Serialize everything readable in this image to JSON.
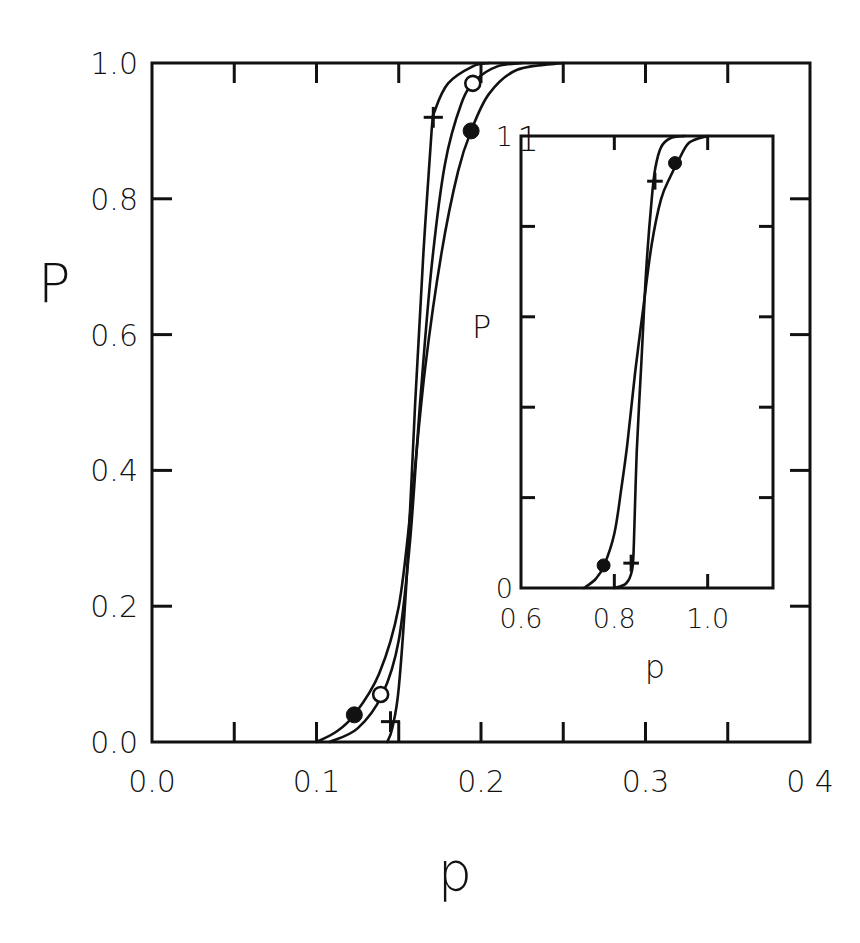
{
  "chart_data": [
    {
      "id": "main",
      "type": "line",
      "title": "",
      "xlabel": "p",
      "ylabel": "P",
      "xlim": [
        0.0,
        0.4
      ],
      "ylim": [
        0.0,
        1.0
      ],
      "grid": false,
      "legend": null,
      "x_ticks": [
        0.0,
        0.05,
        0.1,
        0.15,
        0.2,
        0.25,
        0.3,
        0.35,
        0.4
      ],
      "x_tick_labels": [
        "0.0",
        "0.1",
        "0.2",
        "0.3",
        "0 4"
      ],
      "x_tick_label_values": [
        0.0,
        0.1,
        0.2,
        0.3,
        0.4
      ],
      "y_ticks": [
        0.0,
        0.2,
        0.4,
        0.6,
        0.8,
        1.0
      ],
      "y_tick_labels": [
        "0.0",
        "0.2",
        "0.4",
        "0.6",
        "0.8",
        "1.0"
      ],
      "annotations": [
        {
          "text": "1",
          "x": 0.222,
          "y": 0.87
        }
      ],
      "series": [
        {
          "name": "plus",
          "marker": "plus",
          "x": [
            0.143,
            0.146,
            0.15,
            0.155,
            0.16,
            0.165,
            0.17,
            0.172,
            0.18,
            0.195,
            0.205
          ],
          "y": [
            0.0,
            0.02,
            0.08,
            0.25,
            0.5,
            0.72,
            0.9,
            0.93,
            0.97,
            0.995,
            1.0
          ],
          "marker_points": [
            {
              "x": 0.145,
              "y": 0.03
            },
            {
              "x": 0.171,
              "y": 0.92
            }
          ]
        },
        {
          "name": "open-circle",
          "marker": "open-circle",
          "x": [
            0.108,
            0.125,
            0.14,
            0.15,
            0.157,
            0.163,
            0.17,
            0.178,
            0.188,
            0.197,
            0.21,
            0.225
          ],
          "y": [
            0.0,
            0.02,
            0.07,
            0.15,
            0.3,
            0.5,
            0.7,
            0.85,
            0.94,
            0.975,
            0.995,
            1.0
          ],
          "marker_points": [
            {
              "x": 0.139,
              "y": 0.07
            },
            {
              "x": 0.195,
              "y": 0.97
            }
          ]
        },
        {
          "name": "filled-circle",
          "marker": "filled-circle",
          "x": [
            0.1,
            0.112,
            0.123,
            0.138,
            0.15,
            0.158,
            0.166,
            0.176,
            0.186,
            0.194,
            0.205,
            0.222,
            0.25
          ],
          "y": [
            0.0,
            0.015,
            0.04,
            0.1,
            0.2,
            0.36,
            0.55,
            0.72,
            0.84,
            0.9,
            0.955,
            0.99,
            1.0
          ],
          "marker_points": [
            {
              "x": 0.123,
              "y": 0.04
            },
            {
              "x": 0.194,
              "y": 0.9
            }
          ]
        }
      ]
    },
    {
      "id": "inset",
      "type": "line",
      "title": "",
      "xlabel": "p",
      "ylabel": "P",
      "xlim": [
        0.6,
        1.14
      ],
      "ylim": [
        0.0,
        1.0
      ],
      "grid": false,
      "legend": null,
      "x_ticks": [
        0.8,
        1.0
      ],
      "x_tick_labels": [
        "0.6",
        "0.8",
        "1.0"
      ],
      "x_tick_label_values": [
        0.6,
        0.8,
        1.0
      ],
      "y_ticks": [
        0.2,
        0.4,
        0.6,
        0.8
      ],
      "y_tick_labels": [
        "0",
        "1"
      ],
      "y_tick_label_values": [
        0,
        1
      ],
      "series": [
        {
          "name": "plus",
          "marker": "plus",
          "x": [
            0.8,
            0.825,
            0.838,
            0.842,
            0.848,
            0.858,
            0.868,
            0.88,
            0.888,
            0.9,
            0.92,
            0.95
          ],
          "y": [
            0.0,
            0.01,
            0.04,
            0.1,
            0.3,
            0.5,
            0.7,
            0.86,
            0.93,
            0.975,
            0.995,
            1.0
          ],
          "marker_points": [
            {
              "x": 0.836,
              "y": 0.055
            },
            {
              "x": 0.887,
              "y": 0.9
            }
          ]
        },
        {
          "name": "filled-circle",
          "marker": "filled-circle",
          "x": [
            0.735,
            0.76,
            0.778,
            0.8,
            0.815,
            0.828,
            0.845,
            0.862,
            0.88,
            0.9,
            0.92,
            0.935,
            0.96,
            1.0
          ],
          "y": [
            0.0,
            0.02,
            0.05,
            0.12,
            0.22,
            0.32,
            0.48,
            0.62,
            0.76,
            0.86,
            0.91,
            0.94,
            0.985,
            1.0
          ],
          "marker_points": [
            {
              "x": 0.777,
              "y": 0.05
            },
            {
              "x": 0.93,
              "y": 0.94
            }
          ]
        }
      ]
    }
  ],
  "layout": {
    "main": {
      "left": 152,
      "right": 810,
      "top": 63,
      "bottom": 742
    },
    "inset": {
      "left": 521,
      "right": 773,
      "top": 136,
      "bottom": 588
    },
    "ink": "#111111",
    "background": "#ffffff"
  }
}
